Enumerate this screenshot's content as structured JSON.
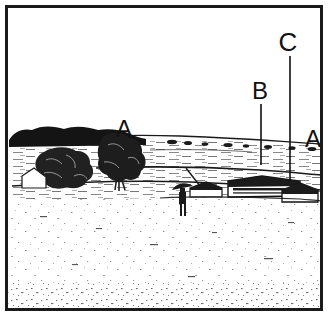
{
  "figure": {
    "kind": "line-drawing-landscape",
    "background_color": "#ffffff",
    "ink_color": "#111111",
    "border": {
      "present": true,
      "color": "#1a1a1a",
      "thickness_px": 3,
      "inset_px": 5
    },
    "annotations": [
      {
        "id": "label-a-left",
        "letter": "A",
        "x": 124,
        "y": 137,
        "font_size": 24,
        "has_leader_line": false,
        "points_at": "tree-line on horizon, left of centre"
      },
      {
        "id": "label-b",
        "letter": "B",
        "x": 260,
        "y": 99,
        "font_size": 24,
        "has_leader_line": true,
        "leader": {
          "x1": 261,
          "y1": 104,
          "x2": 261,
          "y2": 165
        },
        "points_at": "middle-distance field boundary / hedgerow"
      },
      {
        "id": "label-c",
        "letter": "C",
        "x": 288,
        "y": 51,
        "font_size": 26,
        "has_leader_line": true,
        "leader": {
          "x1": 290,
          "y1": 56,
          "x2": 290,
          "y2": 181
        },
        "points_at": "near field boundary in front of farm buildings"
      },
      {
        "id": "label-a-right",
        "letter": "A",
        "x": 313,
        "y": 147,
        "font_size": 24,
        "has_leader_line": false,
        "points_at": "distant horizon tree-line at right edge"
      }
    ],
    "scene": {
      "horizon_y": 140,
      "sky_region": {
        "top": 8,
        "bottom": 140,
        "fill": "#ffffff"
      },
      "elements": [
        {
          "name": "dark-tree-line-left",
          "description": "solid black band of distant woodland along the horizon at the left"
        },
        {
          "name": "foreground-trees",
          "description": "two large dark scribbled deciduous trees left of centre"
        },
        {
          "name": "field-bands",
          "description": "horizontal hatched bands indicating sloping fields and hedgerows"
        },
        {
          "name": "standing-figure",
          "description": "small standing human figure with hat near centre foreground"
        },
        {
          "name": "long-barn",
          "description": "long low farm building with dark roof right of centre"
        },
        {
          "name": "small-outbuilding",
          "description": "smaller roofed outbuilding at the right"
        },
        {
          "name": "foreground-field",
          "description": "large pale speckled field occupying the lower half"
        }
      ]
    }
  }
}
